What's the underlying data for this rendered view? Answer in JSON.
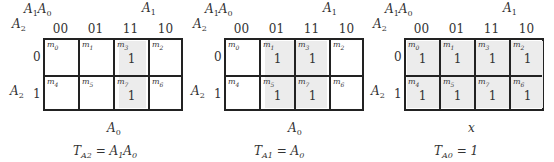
{
  "figure": {
    "variables": {
      "row_var": "A2",
      "col_vars": "A1A0"
    },
    "column_headers": [
      "00",
      "01",
      "11",
      "10"
    ],
    "row_headers": [
      "0",
      "1"
    ],
    "minterm_layout": [
      [
        "m0",
        "m1",
        "m3",
        "m2"
      ],
      [
        "m4",
        "m5",
        "m7",
        "m6"
      ]
    ],
    "shading_color": "#ececec",
    "maps": [
      {
        "id": "TA2",
        "values": [
          [
            "",
            "",
            "1",
            ""
          ],
          [
            "",
            "",
            "1",
            ""
          ]
        ],
        "group": {
          "cols": [
            2
          ],
          "rows": [
            0,
            1
          ]
        },
        "top_brace_label": "A1",
        "left_brace_label": "A2",
        "bottom_brace_label": "A0",
        "formula": {
          "lhs": "T",
          "lhs_sub": "A2",
          "eq": "=",
          "rhs": "A1A0"
        }
      },
      {
        "id": "TA1",
        "values": [
          [
            "",
            "1",
            "1",
            ""
          ],
          [
            "",
            "1",
            "1",
            ""
          ]
        ],
        "group": {
          "cols": [
            1,
            2
          ],
          "rows": [
            0,
            1
          ]
        },
        "top_brace_label": "A1",
        "left_brace_label": "A2",
        "bottom_brace_label": "A0",
        "formula": {
          "lhs": "T",
          "lhs_sub": "A1",
          "eq": "=",
          "rhs": "A0"
        }
      },
      {
        "id": "TA0",
        "values": [
          [
            "1",
            "1",
            "1",
            "1"
          ],
          [
            "1",
            "1",
            "1",
            "1"
          ]
        ],
        "group": {
          "cols": [
            0,
            1,
            2,
            3
          ],
          "rows": [
            0,
            1
          ]
        },
        "top_brace_label": "A1",
        "left_brace_label": "A2",
        "bottom_brace_label": "x",
        "formula": {
          "lhs": "T",
          "lhs_sub": "A0",
          "eq": "=",
          "rhs": "1"
        }
      }
    ]
  }
}
